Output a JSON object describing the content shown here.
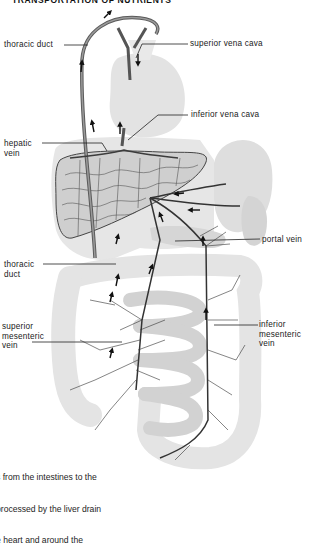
{
  "figure": {
    "title": "TRANSPORTATION OF NUTRIENTS",
    "labels": {
      "thoracic_duct_top": "thoracic duct",
      "superior_vena_cava": "superior vena cava",
      "inferior_vena_cava": "inferior vena cava",
      "hepatic_vein": "hepatic\nvein",
      "portal_vein": "portal vein",
      "thoracic_duct_lower": "thoracic\nduct",
      "superior_mesenteric_vein": "superior\nmesenteric\nvein",
      "inferior_mesenteric_vein": "inferior\nmesenteric\nvein"
    },
    "caption_lines": [
      "s from the intestines to the",
      "processed by the liver drain",
      "e heart and around the"
    ],
    "colors": {
      "organ_fill": "#dcdcdc",
      "organ_light": "#ececec",
      "vessel": "#4a4a4a",
      "vessel_dark": "#2a2a2a",
      "text": "#1a1a1a"
    }
  }
}
